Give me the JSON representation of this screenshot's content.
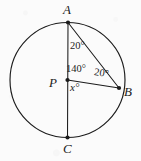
{
  "figure": {
    "kind": "circle-geometry-diagram",
    "background_color": "#fbfbfb",
    "stroke_color": "#1b1b1b",
    "circle": {
      "center_x": 67.5,
      "center_y": 80,
      "radius": 57.5
    },
    "points": [
      {
        "id": "A",
        "label": "A",
        "x": 68,
        "y": 22.5,
        "label_x": 63,
        "label_y": 3
      },
      {
        "id": "P",
        "label": "P",
        "x": 67.5,
        "y": 80,
        "label_x": 49,
        "label_y": 76
      },
      {
        "id": "B",
        "label": "B",
        "x": 119,
        "y": 88,
        "label_x": 124,
        "label_y": 85
      },
      {
        "id": "C",
        "label": "C",
        "x": 67.5,
        "y": 137.5,
        "label_x": 63,
        "label_y": 142
      }
    ],
    "segments": [
      {
        "id": "AC",
        "from": "A",
        "to": "C",
        "note": "vertical diameter"
      },
      {
        "id": "AB",
        "from": "A",
        "to": "B",
        "note": "chord"
      },
      {
        "id": "PB",
        "from": "P",
        "to": "B",
        "note": "radius"
      }
    ],
    "angle_labels": [
      {
        "id": "angle-bac",
        "text": "20°",
        "x": 70,
        "y": 41,
        "variant": "plain",
        "at_vertex": "A"
      },
      {
        "id": "angle-apb",
        "text": "140°",
        "x": 66,
        "y": 64,
        "variant": "plain",
        "at_vertex": "P"
      },
      {
        "id": "angle-abp",
        "text": "20°",
        "x": 95,
        "y": 67,
        "variant": "tilted",
        "at_vertex": "B"
      },
      {
        "id": "angle-x",
        "text": "x°",
        "x": 70,
        "y": 82,
        "variant": "var",
        "at_vertex": "P"
      }
    ]
  }
}
